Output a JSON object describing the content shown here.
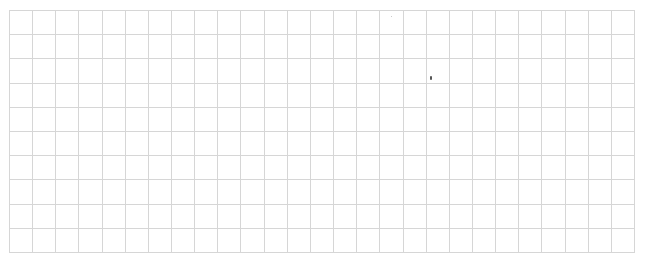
{
  "grid": {
    "columns": 27,
    "rows": 10,
    "line_color": "#d6d6d6",
    "background": "#ffffff"
  },
  "marks": [
    {
      "x": 430,
      "y": 76,
      "w": 2,
      "h": 4,
      "color": "#555555"
    },
    {
      "x": 391,
      "y": 16,
      "w": 1,
      "h": 1,
      "color": "#bbbbbb"
    }
  ]
}
